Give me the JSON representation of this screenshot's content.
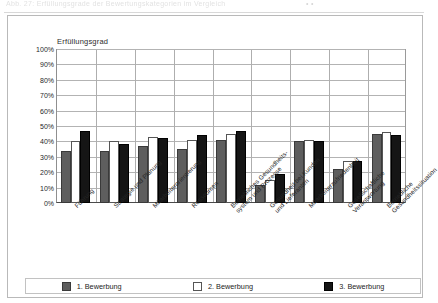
{
  "scan": {
    "header_text": "Abb. 27: Erfüllungsgrade der Bewertungskategorien im Vergleich",
    "header_glyphs": "•  •"
  },
  "chart_data": {
    "type": "bar",
    "title": "Erfüllungsgrad",
    "xlabel": "",
    "ylabel": "",
    "ylim": [
      0,
      100
    ],
    "yticks": [
      "0%",
      "10%",
      "20%",
      "30%",
      "40%",
      "50%",
      "60%",
      "70%",
      "80%",
      "90%",
      "100%"
    ],
    "ytick_values": [
      0,
      10,
      20,
      30,
      40,
      50,
      60,
      70,
      80,
      90,
      100
    ],
    "grid": true,
    "legend_position": "bottom",
    "categories": [
      "Führung",
      "Strategie und Planung",
      "Mitarbeiterorientierung",
      "Ressourcen",
      "Betriebliches Gesundheits-\nsystem und Prozesse",
      "Gesundheit bei Kunden\nund Lieferanten",
      "Mitarbeiterzufriedenheit",
      "Gesellschaftliche\nVerantwortung",
      "Betriebliche\nGesundheitssituation"
    ],
    "series": [
      {
        "name": "1. Bewerbung",
        "color": "#5e5e5e",
        "values": [
          34,
          34,
          37,
          35,
          41,
          12,
          40,
          22,
          45
        ]
      },
      {
        "name": "2. Bewerbung",
        "color": "#ffffff",
        "values": [
          40,
          40,
          43,
          41,
          45,
          15,
          41,
          27,
          46
        ]
      },
      {
        "name": "3. Bewerbung",
        "color": "#151515",
        "values": [
          47,
          38,
          42,
          44,
          47,
          19,
          40,
          27,
          44
        ]
      }
    ]
  },
  "legend": {
    "items": [
      {
        "label": "1. Bewerbung",
        "series": 0
      },
      {
        "label": "2. Bewerbung",
        "series": 1
      },
      {
        "label": "3. Bewerbung",
        "series": 2
      }
    ]
  }
}
